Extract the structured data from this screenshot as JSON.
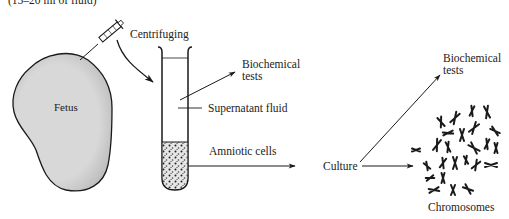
{
  "diagram": {
    "top_caption": "(15–20 ml of fluid)",
    "labels": {
      "fetus": "Fetus",
      "centrifuging": "Centrifuging",
      "biochemical_tests_1_line1": "Biochemical",
      "biochemical_tests_1_line2": "tests",
      "supernatant": "Supernatant fluid",
      "amniotic_cells": "Amniotic cells",
      "culture": "Culture",
      "biochemical_tests_2_line1": "Biochemical",
      "biochemical_tests_2_line2": "tests",
      "chromosomes": "Chromosomes"
    },
    "flow": [
      {
        "from": "Fetus",
        "to": "Test tube",
        "via": "Centrifuging"
      },
      {
        "from": "Supernatant fluid",
        "to": "Biochemical tests"
      },
      {
        "from": "Amniotic cells",
        "to": "Culture"
      },
      {
        "from": "Culture",
        "to": "Biochemical tests"
      },
      {
        "from": "Culture",
        "to": "Chromosomes"
      }
    ],
    "colors": {
      "line": "#1a1a1a",
      "fetus_fill": "#d9d9d9",
      "text": "#222222"
    }
  }
}
